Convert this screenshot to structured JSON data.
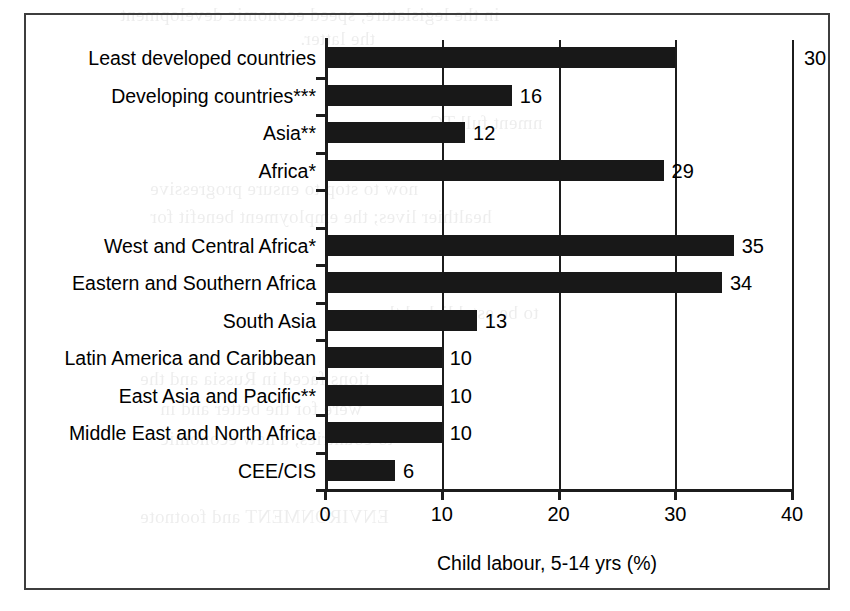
{
  "chart_data": {
    "type": "bar",
    "orientation": "horizontal",
    "title": "",
    "xlabel": "Child labour, 5-14 yrs (%)",
    "ylabel": "",
    "xlim": [
      0,
      40
    ],
    "xticks": [
      0,
      10,
      20,
      30,
      40
    ],
    "grid": true,
    "legend": null,
    "bar_color": "#181818",
    "categories": [
      "Least developed countries",
      "Developing countries***",
      "Asia**",
      "Africa*",
      "",
      "West and Central Africa*",
      "Eastern and Southern Africa",
      "South Asia",
      "Latin America and Caribbean",
      "East Asia and Pacific**",
      "Middle East and North Africa",
      "CEE/CIS"
    ],
    "values": [
      30,
      16,
      12,
      29,
      null,
      35,
      34,
      13,
      10,
      10,
      10,
      6
    ],
    "value_labels": [
      "30",
      "16",
      "12",
      "29",
      "",
      "35",
      "34",
      "13",
      "10",
      "10",
      "10",
      "6"
    ]
  },
  "axis": {
    "tick_labels": [
      "0",
      "10",
      "20",
      "30",
      "40"
    ],
    "title": "Child labour, 5-14 yrs (%)"
  },
  "bleed_text": {
    "lines": [
      "in the legislature, speed economic development",
      "the latter.",
      "nment full TC",
      "now to stop to ensure progressive",
      "healthier lives; the employment benefit for",
      "to be established there",
      "tions faced in Russia and the",
      "were for the better and in",
      "to countries, a new economic",
      "ENVIRONMENT and footnote"
    ]
  }
}
